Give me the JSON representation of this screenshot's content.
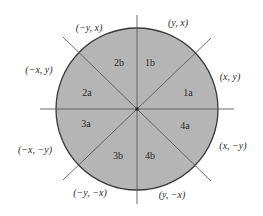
{
  "diagram": {
    "center": {
      "x": 137,
      "y": 109
    },
    "radius": 81,
    "colors": {
      "fill": "#b5b5b5",
      "circle_stroke": "#3a3a3a",
      "axis_stroke": "#5a5a5a",
      "text": "#2a2a2a"
    },
    "regions": [
      {
        "id": "1a",
        "label": "1a",
        "x": 188,
        "y": 94
      },
      {
        "id": "1b",
        "label": "1b",
        "x": 150,
        "y": 64
      },
      {
        "id": "2a",
        "label": "2a",
        "x": 87,
        "y": 94
      },
      {
        "id": "2b",
        "label": "2b",
        "x": 119,
        "y": 64
      },
      {
        "id": "3a",
        "label": "3a",
        "x": 86,
        "y": 125
      },
      {
        "id": "3b",
        "label": "3b",
        "x": 118,
        "y": 157
      },
      {
        "id": "4a",
        "label": "4a",
        "x": 185,
        "y": 127
      },
      {
        "id": "4b",
        "label": "4b",
        "x": 150,
        "y": 157
      }
    ],
    "points": [
      {
        "id": "x-y",
        "label": "(x, y)",
        "x": 230,
        "y": 78
      },
      {
        "id": "y-x",
        "label": "(y, x)",
        "x": 178,
        "y": 24
      },
      {
        "id": "neg-y-x",
        "label": "(−y, x)",
        "x": 89,
        "y": 29
      },
      {
        "id": "neg-x-y",
        "label": "(−x, y)",
        "x": 39,
        "y": 71
      },
      {
        "id": "neg-x-neg-y",
        "label": "(−x, −y)",
        "x": 35,
        "y": 151
      },
      {
        "id": "neg-y-neg-x",
        "label": "(−y, −x)",
        "x": 90,
        "y": 194
      },
      {
        "id": "y-neg-x",
        "label": "(y, −x)",
        "x": 172,
        "y": 196
      },
      {
        "id": "x-neg-y",
        "label": "(x, −y)",
        "x": 233,
        "y": 147
      }
    ]
  }
}
